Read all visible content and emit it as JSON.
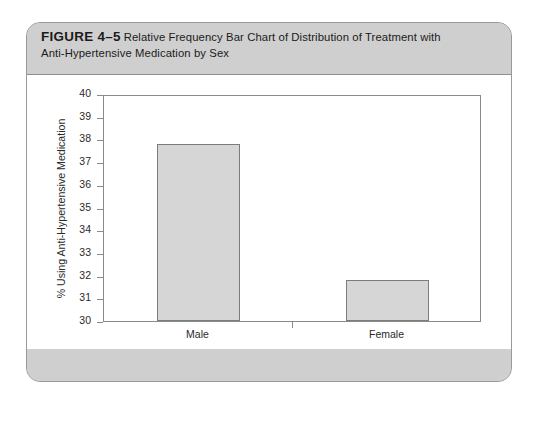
{
  "figure": {
    "label": "FIGURE 4–5",
    "caption_line1": "Relative Frequency Bar Chart of Distribution of Treatment with",
    "caption_line2": "Anti-Hypertensive Medication by Sex"
  },
  "colors": {
    "card_band": "#cfcfcf",
    "panel": "#ffffff",
    "bar_fill": "#d6d6d6",
    "bar_border": "#7c7c7c",
    "axis": "#8a8a8a",
    "text": "#2a2a2a"
  },
  "chart_data": {
    "type": "bar",
    "title": "Relative Frequency Bar Chart of Distribution of Treatment with Anti-Hypertensive Medication by Sex",
    "categories": [
      "Male",
      "Female"
    ],
    "values": [
      37.8,
      31.8
    ],
    "xlabel": "Gender",
    "ylabel": "% Using Anti-Hypertensive Medication",
    "ylim": [
      30,
      40
    ],
    "ytick_labels": [
      "40",
      "39",
      "38",
      "37",
      "36",
      "35",
      "34",
      "33",
      "32",
      "31",
      "30"
    ],
    "ytick_values": [
      40,
      39,
      38,
      37,
      36,
      35,
      34,
      33,
      32,
      31,
      30
    ],
    "grid": false,
    "legend": "none"
  }
}
